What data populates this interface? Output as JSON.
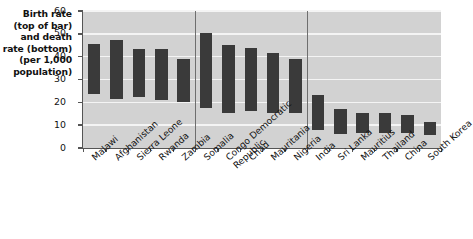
{
  "chart_data": {
    "type": "bar",
    "title": "",
    "subtitle": "",
    "xlabel": "",
    "ylabel": "Birth rate (top of bar) and death rate (bottom) (per 1,000 population)",
    "ylabel_lines": [
      "Birth rate",
      "(top of bar)",
      "and death",
      "rate (bottom)",
      "(per 1,000",
      "population)"
    ],
    "ylim": [
      0,
      60
    ],
    "yticks": [
      0,
      10,
      20,
      30,
      40,
      50,
      60
    ],
    "ytick_labels": [
      "0",
      "10",
      "20",
      "30",
      "40",
      "50",
      "60"
    ],
    "grid": true,
    "grid_color": "#f4f4f4",
    "plot_background": "#d2d2d2",
    "bar_color": "#3a3a3a",
    "legend": [],
    "note": "Floating bars: top of bar = birth rate, bottom of bar = death rate",
    "group_separators": [
      5,
      10
    ],
    "groups": [
      {
        "name": "group-1",
        "count": 5
      },
      {
        "name": "group-2",
        "count": 5
      },
      {
        "name": "group-3",
        "count": 6
      }
    ],
    "categories": [
      "Malawi",
      "Afghanistan",
      "Sierra Leone",
      "Rwanda",
      "Zambia",
      "Somalia",
      "Congo Democratic Republic",
      "Chad",
      "Mauritania",
      "Nigeria",
      "India",
      "Sri Lanka",
      "Mauritius",
      "Thailand",
      "China",
      "South Korea"
    ],
    "category_label_lines": [
      [
        "Malawi"
      ],
      [
        "Afghanistan"
      ],
      [
        "Sierra Leone"
      ],
      [
        "Rwanda"
      ],
      [
        "Zambia"
      ],
      [
        "Somalia"
      ],
      [
        "Congo Democratic",
        "Republic"
      ],
      [
        "Chad"
      ],
      [
        "Mauritania"
      ],
      [
        "Nigeria"
      ],
      [
        "India"
      ],
      [
        "Sri Lanka"
      ],
      [
        "Mauritius"
      ],
      [
        "Thailand"
      ],
      [
        "China"
      ],
      [
        "South Korea"
      ]
    ],
    "series": [
      {
        "name": "Birth rate",
        "values": [
          45.5,
          47.5,
          43.5,
          43.5,
          39.0,
          50.5,
          45.0,
          44.0,
          41.5,
          39.0,
          23.0,
          17.0,
          15.5,
          15.5,
          14.5,
          11.5
        ]
      },
      {
        "name": "Death rate",
        "values": [
          23.5,
          21.5,
          22.5,
          21.0,
          20.0,
          17.5,
          15.5,
          16.0,
          15.5,
          15.5,
          8.0,
          6.0,
          6.5,
          6.5,
          6.5,
          5.5
        ]
      }
    ]
  }
}
